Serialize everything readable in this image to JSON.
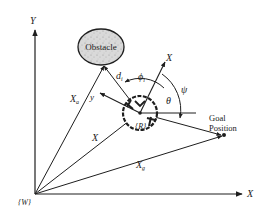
{
  "diagram": {
    "colors": {
      "ink": "#1e1e1e",
      "obstacle_fill": "#d8d8d8",
      "background": "#ffffff"
    },
    "world_frame": {
      "label": "{W}",
      "x_axis_label": "X",
      "y_axis_label": "Y"
    },
    "obstacle": {
      "label": "Obstacle"
    },
    "robot": {
      "label": "{R}",
      "local_x_label": "X",
      "local_y_label": "y"
    },
    "goal": {
      "label_line1": "Goal",
      "label_line2": "Position"
    },
    "vectors": {
      "obstacle_position": {
        "label": "X",
        "subscript": "a"
      },
      "robot_position": {
        "label": "X"
      },
      "goal_position": {
        "label": "X",
        "subscript": "g"
      },
      "obstacle_distance": {
        "label": "d",
        "subscript": "i"
      }
    },
    "angles": {
      "phi_i": {
        "label": "ϕ",
        "subscript": "i"
      },
      "theta": {
        "label": "θ"
      },
      "psi": {
        "label": "ψ"
      }
    }
  }
}
